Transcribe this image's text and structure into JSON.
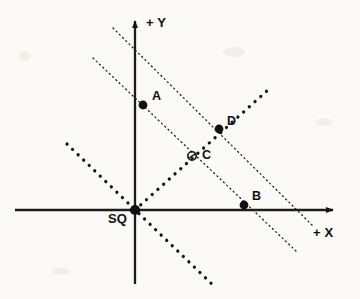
{
  "figure": {
    "background_color": "#fbfaf7",
    "ink_color": "#141414"
  },
  "axes": {
    "x_axis_label": "+ X",
    "y_axis_label": "+ Y",
    "origin_label": "SQ",
    "x_axis": {
      "x1": 15,
      "y1": 210,
      "x2": 341,
      "y2": 210,
      "arrow": "right"
    },
    "y_axis": {
      "x1": 135,
      "y1": 284,
      "x2": 135,
      "y2": 14,
      "arrow": "up"
    }
  },
  "points": [
    {
      "name": "A",
      "label": "A",
      "x": 143,
      "y": 105,
      "marker": "filled-dot",
      "label_x": 152,
      "label_y": 90
    },
    {
      "name": "B",
      "label": "B",
      "x": 244,
      "y": 205,
      "marker": "filled-dot",
      "label_x": 252,
      "label_y": 190
    },
    {
      "name": "C",
      "label": "C",
      "x": 192,
      "y": 156,
      "marker": "open-circle",
      "label_x": 202,
      "label_y": 149
    },
    {
      "name": "D",
      "label": "D",
      "x": 219,
      "y": 129,
      "marker": "filled-dot",
      "label_x": 227,
      "label_y": 115
    },
    {
      "name": "SQ",
      "label": "SQ",
      "x": 135,
      "y": 210,
      "marker": "filled-dot-large",
      "label_x": 108,
      "label_y": 213
    }
  ],
  "lines": [
    {
      "name": "fine-dotted-line-upper",
      "style": "fine-dotted",
      "description": "parallel line passing through D",
      "x1": 113,
      "y1": 28,
      "x2": 313,
      "y2": 226
    },
    {
      "name": "fine-dotted-line-lower",
      "style": "fine-dotted",
      "description": "parallel line passing through A and B",
      "x1": 93,
      "y1": 58,
      "x2": 296,
      "y2": 251
    },
    {
      "name": "thick-dotted-line-ac",
      "style": "thick-dotted",
      "description": "line from upper-left through origin SQ to lower-right",
      "x1": 67,
      "y1": 144,
      "x2": 216,
      "y2": 288
    },
    {
      "name": "thick-dotted-line-bd",
      "style": "thick-dotted",
      "description": "line from origin SQ through C and D to upper-right",
      "x1": 135,
      "y1": 210,
      "x2": 269,
      "y2": 89
    }
  ]
}
